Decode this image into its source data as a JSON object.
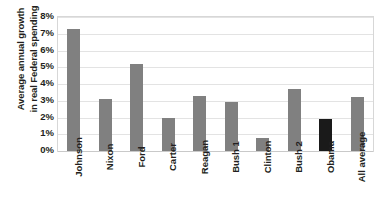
{
  "chart_data": {
    "type": "bar",
    "title": "",
    "subtitle": "",
    "xlabel": "",
    "ylabel": "Average annual growth in real Federal spending",
    "ylabel_lines": [
      "Average annual growth",
      "in real Federal spending"
    ],
    "categories": [
      "Johnson",
      "Nixon",
      "Ford",
      "Carter",
      "Reagan",
      "Bush 1",
      "Clinton",
      "Bush 2",
      "Obama",
      "All average"
    ],
    "values": [
      7.3,
      3.1,
      5.2,
      2.0,
      3.3,
      2.9,
      0.8,
      3.7,
      1.9,
      3.2
    ],
    "value_unit": "%",
    "ylim": [
      0,
      8
    ],
    "ytick_values": [
      0,
      1,
      2,
      3,
      4,
      5,
      6,
      7,
      8
    ],
    "ytick_labels": [
      "0%",
      "1%",
      "2%",
      "3%",
      "4%",
      "5%",
      "6%",
      "7%",
      "8%"
    ],
    "grid": true,
    "grid_axis": "y",
    "legend": false,
    "legend_position": "none",
    "bar_color": "#808080",
    "highlight_color": "#1a1a1a",
    "highlight_categories": [
      "Obama"
    ],
    "gridline_color": "#e3e3e3",
    "plot_border_color": "#d7d7d7",
    "text_color": "#231f20",
    "background_color": "#ffffff",
    "annotations": []
  }
}
